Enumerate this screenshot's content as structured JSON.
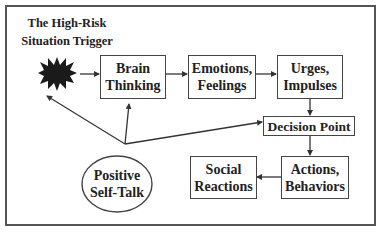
{
  "title": {
    "line1": "The High-Risk",
    "line2": "Situation Trigger"
  },
  "nodes": {
    "trigger": {
      "icon": "starburst-icon"
    },
    "brain": {
      "line1": "Brain",
      "line2": "Thinking"
    },
    "emotions": {
      "line1": "Emotions,",
      "line2": "Feelings"
    },
    "urges": {
      "line1": "Urges,",
      "line2": "Impulses"
    },
    "decision": {
      "label": "Decision Point"
    },
    "actions": {
      "line1": "Actions,",
      "line2": "Behaviors"
    },
    "social": {
      "line1": "Social",
      "line2": "Reactions"
    },
    "selftalk": {
      "line1": "Positive",
      "line2": "Self-Talk"
    }
  },
  "edges": [
    {
      "from": "trigger",
      "to": "brain"
    },
    {
      "from": "brain",
      "to": "emotions"
    },
    {
      "from": "emotions",
      "to": "urges"
    },
    {
      "from": "urges",
      "to": "decision"
    },
    {
      "from": "decision",
      "to": "actions"
    },
    {
      "from": "actions",
      "to": "social"
    },
    {
      "from": "selftalk",
      "to": "trigger"
    },
    {
      "from": "selftalk",
      "to": "brain"
    },
    {
      "from": "selftalk",
      "to": "decision"
    }
  ],
  "colors": {
    "line": "#333333",
    "fill_dark": "#1a1a1a",
    "border": "#555555"
  }
}
